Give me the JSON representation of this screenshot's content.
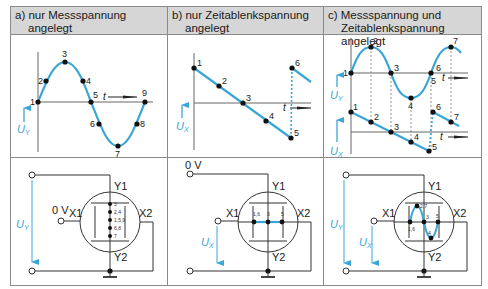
{
  "headers": {
    "a": {
      "line1": "a) nur Messspannung",
      "line2": "angelegt"
    },
    "b": {
      "line1": "b) nur Zeitablenkspannung",
      "line2": "angelegt"
    },
    "c": {
      "line1": "c) Messspannung und",
      "line2": "Zeitablenkspannung angelegt"
    }
  },
  "labels": {
    "uy": "U",
    "uy_sub": "Y",
    "ux": "U",
    "ux_sub": "X",
    "t": "t",
    "zero_volt": "0 V",
    "y1": "Y1",
    "y2": "Y2",
    "x1": "X1",
    "x2": "X2"
  },
  "panel_a_points": [
    "1",
    "2",
    "3",
    "4",
    "5",
    "6",
    "7",
    "8",
    "9"
  ],
  "panel_a_screen_labels": [
    "3",
    "2,4",
    "1,5,9",
    "6,8",
    "7"
  ],
  "panel_b_points": [
    "1",
    "2",
    "3",
    "4",
    "5",
    "6"
  ],
  "panel_b_screen_labels": [
    "1,6",
    "3",
    "5"
  ],
  "panel_c_upper_points": [
    "1",
    "2",
    "3",
    "4",
    "5",
    "6",
    "7"
  ],
  "panel_c_lower_points": [
    "1",
    "2",
    "3",
    "4",
    "5",
    "6",
    "7"
  ],
  "panel_c_screen_labels": [
    "1,6",
    "2,7",
    "3",
    "4",
    "5"
  ],
  "colors": {
    "curve": "#3aa6d8",
    "arrow": "#3aa6d8",
    "line": "#333333",
    "header_bg": "#d6d6d6",
    "border": "#8a8a8a"
  }
}
